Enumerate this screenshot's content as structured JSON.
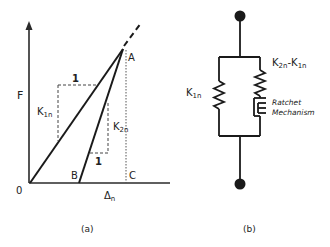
{
  "panel_a": {
    "caption": "(a)",
    "y_axis_label": "F",
    "x_axis_label": "Δ",
    "x_axis_label_sub": "n",
    "origin_label": "0",
    "points": {
      "A": "A",
      "B": "B",
      "C": "C"
    },
    "slope_1": {
      "run_label": "1",
      "rise_label": "K",
      "rise_sub": "1n"
    },
    "slope_2": {
      "run_label": "1",
      "rise_label": "K",
      "rise_sub": "2n"
    }
  },
  "panel_b": {
    "caption": "(b)",
    "left_spring_label": "K",
    "left_spring_sub": "1n",
    "right_spring_label_a": "K",
    "right_spring_sub_a": "2n",
    "right_spring_dash": "-K",
    "right_spring_sub_b": "1n",
    "ratchet_label_line1": "Ratchet",
    "ratchet_label_line2": "Mechanism"
  },
  "colors": {
    "line": "#222222",
    "dashed": "#444444",
    "background": "#ffffff"
  }
}
